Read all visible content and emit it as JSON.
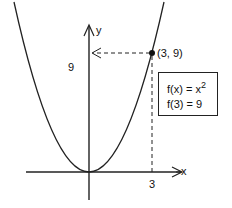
{
  "diagram": {
    "axes": {
      "x_label": "x",
      "y_label": "y"
    },
    "point_label": "(3, 9)",
    "x_tick": "3",
    "y_tick": "9",
    "function_box": {
      "line1_prefix": "f(x) = x",
      "line1_exponent": "2",
      "line2": "f(3) = 9"
    },
    "colors": {
      "ink": "#111111",
      "background": "#ffffff"
    }
  }
}
